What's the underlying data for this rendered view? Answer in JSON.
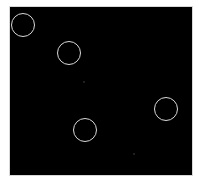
{
  "image": {
    "background": "#ffffff",
    "panel": {
      "x": 10,
      "y": 7,
      "width": 182,
      "height": 168,
      "color": "#000000",
      "border_color": "#d8d8d8"
    },
    "circles": [
      {
        "cx": 23,
        "cy": 25,
        "r": 12,
        "stroke": "#d9d9d9"
      },
      {
        "cx": 69,
        "cy": 53,
        "r": 12,
        "stroke": "#d9d9d9"
      },
      {
        "cx": 166,
        "cy": 109,
        "r": 12,
        "stroke": "#d9d9d9"
      },
      {
        "cx": 85,
        "cy": 130,
        "r": 12,
        "stroke": "#d9d9d9"
      }
    ],
    "specks": [
      {
        "x": 83,
        "y": 81
      },
      {
        "x": 133,
        "y": 153
      }
    ]
  }
}
